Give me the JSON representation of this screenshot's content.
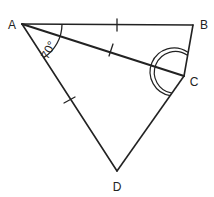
{
  "diagram": {
    "colors": {
      "stroke": "#222222",
      "background": "#ffffff"
    },
    "vertices": {
      "A": {
        "label": "A",
        "x": 22,
        "y": 24,
        "label_x": 12,
        "label_y": 29
      },
      "B": {
        "label": "B",
        "x": 193,
        "y": 25,
        "label_x": 204,
        "label_y": 28
      },
      "C": {
        "label": "C",
        "x": 184,
        "y": 76,
        "label_x": 194,
        "label_y": 86
      },
      "D": {
        "label": "D",
        "x": 117,
        "y": 171,
        "label_x": 117,
        "label_y": 190
      }
    },
    "segments": [
      "AB",
      "BC",
      "CD",
      "DA",
      "AC"
    ],
    "equal_marks": [
      "AB",
      "AC",
      "AD"
    ],
    "angle_label": "70°",
    "angle_at": "A",
    "angle_between": [
      "AB",
      "AD"
    ],
    "equal_angle_marks_at": "C",
    "equal_angle_note": "double arc at C marks angle BCA = angle ACD"
  }
}
